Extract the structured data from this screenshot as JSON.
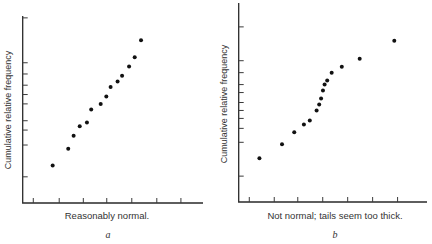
{
  "chart_data": [
    {
      "type": "scatter",
      "panel_label": "a",
      "title": "",
      "xlabel": "Reasonably normal.",
      "ylabel": "Cumulative relative frequency",
      "xlim": [
        0,
        8
      ],
      "ylim": [
        0,
        1
      ],
      "grid": false,
      "x_ticks": [
        0.47,
        1.62,
        2.69,
        3.73,
        4.84,
        5.95,
        7.02
      ],
      "y_ticks": [
        0.14,
        0.31,
        0.39,
        0.44,
        0.53,
        0.58,
        0.63,
        0.69,
        0.75,
        0.99
      ],
      "x_tick_labels": [],
      "y_tick_labels": [],
      "points": [
        [
          1.33,
          0.2
        ],
        [
          2.02,
          0.29
        ],
        [
          2.26,
          0.36
        ],
        [
          2.53,
          0.41
        ],
        [
          2.85,
          0.43
        ],
        [
          3.04,
          0.5
        ],
        [
          3.46,
          0.53
        ],
        [
          3.71,
          0.57
        ],
        [
          3.9,
          0.62
        ],
        [
          4.21,
          0.65
        ],
        [
          4.41,
          0.68
        ],
        [
          4.72,
          0.73
        ],
        [
          4.97,
          0.78
        ],
        [
          5.25,
          0.87
        ]
      ]
    },
    {
      "type": "scatter",
      "panel_label": "b",
      "title": "",
      "xlabel": "Not normal; tails seem too thick.",
      "ylabel": "Cumulative relative frequency",
      "xlim": [
        0,
        8
      ],
      "ylim": [
        0,
        1
      ],
      "grid": false,
      "x_ticks": [
        0.45,
        1.51,
        2.51,
        3.57,
        4.63,
        5.69,
        6.75
      ],
      "y_ticks": [
        0.13,
        0.3,
        0.37,
        0.42,
        0.46,
        0.5,
        0.55,
        0.59,
        0.65,
        0.71,
        0.88
      ],
      "x_tick_labels": [],
      "y_tick_labels": [],
      "points": [
        [
          0.88,
          0.22
        ],
        [
          1.84,
          0.29
        ],
        [
          2.36,
          0.35
        ],
        [
          2.77,
          0.39
        ],
        [
          3.02,
          0.41
        ],
        [
          3.31,
          0.46
        ],
        [
          3.42,
          0.49
        ],
        [
          3.5,
          0.52
        ],
        [
          3.58,
          0.56
        ],
        [
          3.65,
          0.59
        ],
        [
          3.76,
          0.61
        ],
        [
          3.95,
          0.65
        ],
        [
          4.38,
          0.68
        ],
        [
          5.14,
          0.72
        ],
        [
          6.61,
          0.81
        ]
      ]
    }
  ]
}
